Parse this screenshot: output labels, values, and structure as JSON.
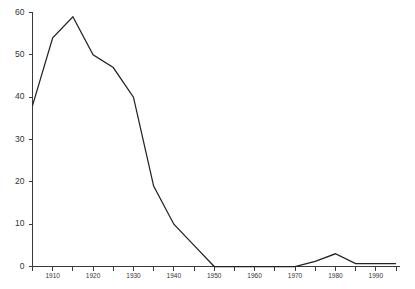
{
  "chart_data": {
    "type": "line",
    "title": "",
    "subtitle": "",
    "xlabel": "",
    "ylabel": "",
    "xlim": [
      1905,
      1996
    ],
    "ylim": [
      0,
      60
    ],
    "grid": false,
    "legend": "none",
    "y_ticks": [
      0,
      10,
      20,
      30,
      40,
      50,
      60
    ],
    "y_tick_labels": [
      "0",
      "10",
      "20",
      "30",
      "40",
      "50",
      "60"
    ],
    "x_ticks": [
      1905,
      1910,
      1915,
      1920,
      1925,
      1930,
      1935,
      1940,
      1945,
      1950,
      1955,
      1960,
      1965,
      1970,
      1975,
      1980,
      1985,
      1990,
      1995
    ],
    "x_tick_labels": [
      "",
      "1910",
      "",
      "1920",
      "",
      "1930",
      "",
      "1940",
      "",
      "1950",
      "",
      "1960",
      "",
      "1970",
      "",
      "1980",
      "",
      "1990",
      ""
    ],
    "x_minor_step": 5,
    "series": [
      {
        "name": "series-1",
        "color": "#222222",
        "x": [
          1905,
          1910,
          1915,
          1920,
          1925,
          1930,
          1935,
          1940,
          1945,
          1950,
          1955,
          1960,
          1965,
          1970,
          1975,
          1980,
          1985,
          1990,
          1995
        ],
        "values": [
          38,
          54,
          59,
          50,
          47,
          40,
          19,
          10,
          5,
          0,
          0,
          0,
          0,
          0,
          1.2,
          3,
          0.7,
          0.7,
          0.7
        ]
      }
    ],
    "annotations": []
  },
  "axes": {
    "y_axis_name": "y-axis",
    "x_axis_name": "x-axis"
  }
}
